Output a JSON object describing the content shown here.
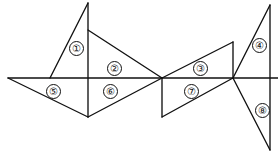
{
  "figure": {
    "width": 278,
    "height": 157,
    "background_color": "#ffffff",
    "stroke_color": "#111111",
    "points": {
      "A_left_end": [
        8,
        78
      ],
      "B_left_diag_foot": [
        50,
        78
      ],
      "C_left_peak": [
        88,
        3
      ],
      "D_upper_mid_vertex": [
        88,
        30
      ],
      "E_mid_on_base": [
        88,
        78
      ],
      "F_left_bottom_vertex": [
        88,
        117
      ],
      "G_center_junction": [
        162,
        78
      ],
      "H_center_bottom_vertex": [
        162,
        117
      ],
      "I_right_vert_top": [
        233,
        42
      ],
      "J_right_junction": [
        233,
        78
      ],
      "K_right_peak": [
        270,
        5
      ],
      "L_right_base": [
        270,
        78
      ],
      "M_right_bottom": [
        270,
        150
      ],
      "N_base_right_end": [
        278,
        78
      ]
    },
    "segments": [
      {
        "name": "baseline",
        "from": "A_left_end",
        "to": "N_base_right_end"
      },
      {
        "name": "left-peak-diagonal",
        "from": "C_left_peak",
        "to": "B_left_diag_foot"
      },
      {
        "name": "left-vertical",
        "from": "C_left_peak",
        "to": "F_left_bottom_vertex"
      },
      {
        "name": "region2-upper-edge",
        "from": "D_upper_mid_vertex",
        "to": "G_center_junction"
      },
      {
        "name": "region5-lower-edge",
        "from": "A_left_end",
        "to": "F_left_bottom_vertex"
      },
      {
        "name": "region6-lower-edge",
        "from": "F_left_bottom_vertex",
        "to": "G_center_junction"
      },
      {
        "name": "center-vertical",
        "from": "G_center_junction",
        "to": "H_center_bottom_vertex"
      },
      {
        "name": "region7-lower-edge",
        "from": "H_center_bottom_vertex",
        "to": "J_right_junction"
      },
      {
        "name": "region3-upper-edge",
        "from": "G_center_junction",
        "to": "I_right_vert_top"
      },
      {
        "name": "right-vertical-upper",
        "from": "I_right_vert_top",
        "to": "J_right_junction"
      },
      {
        "name": "right-peak-diagonal",
        "from": "K_right_peak",
        "to": "J_right_junction"
      },
      {
        "name": "far-right-vertical",
        "from": "K_right_peak",
        "to": "M_right_bottom"
      },
      {
        "name": "region8-diagonal",
        "from": "J_right_junction",
        "to": "M_right_bottom"
      }
    ],
    "labels": [
      {
        "id": "label-1",
        "text": "①",
        "number": 1,
        "x": 76,
        "y": 48
      },
      {
        "id": "label-2",
        "text": "②",
        "number": 2,
        "x": 114,
        "y": 68
      },
      {
        "id": "label-3",
        "text": "③",
        "number": 3,
        "x": 200,
        "y": 68
      },
      {
        "id": "label-4",
        "text": "④",
        "number": 4,
        "x": 259,
        "y": 45
      },
      {
        "id": "label-5",
        "text": "⑤",
        "number": 5,
        "x": 53,
        "y": 91
      },
      {
        "id": "label-6",
        "text": "⑥",
        "number": 6,
        "x": 110,
        "y": 91
      },
      {
        "id": "label-7",
        "text": "⑦",
        "number": 7,
        "x": 191,
        "y": 91
      },
      {
        "id": "label-8",
        "text": "⑧",
        "number": 8,
        "x": 262,
        "y": 110
      }
    ]
  }
}
